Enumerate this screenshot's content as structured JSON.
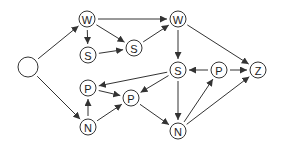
{
  "diagram": {
    "type": "directed-graph",
    "colors": {
      "stroke": "#333333",
      "node_fill": "#ffffff",
      "label": "#222222"
    },
    "nodes": [
      {
        "id": "start",
        "label": "",
        "x": 28,
        "y": 67,
        "r": 10
      },
      {
        "id": "w1",
        "label": "W",
        "x": 87,
        "y": 19,
        "r": 8
      },
      {
        "id": "s1",
        "label": "S",
        "x": 88,
        "y": 55,
        "r": 8
      },
      {
        "id": "s2",
        "label": "S",
        "x": 134,
        "y": 48,
        "r": 8
      },
      {
        "id": "w2",
        "label": "W",
        "x": 178,
        "y": 19,
        "r": 8
      },
      {
        "id": "s3",
        "label": "S",
        "x": 178,
        "y": 70,
        "r": 8
      },
      {
        "id": "p3",
        "label": "P",
        "x": 219,
        "y": 70,
        "r": 8
      },
      {
        "id": "z",
        "label": "Z",
        "x": 258,
        "y": 70,
        "r": 8
      },
      {
        "id": "p1",
        "label": "P",
        "x": 88,
        "y": 88,
        "r": 8
      },
      {
        "id": "p2",
        "label": "P",
        "x": 131,
        "y": 98,
        "r": 8
      },
      {
        "id": "n1",
        "label": "N",
        "x": 88,
        "y": 127,
        "r": 8
      },
      {
        "id": "n2",
        "label": "N",
        "x": 178,
        "y": 131,
        "r": 8
      }
    ],
    "edges": [
      {
        "from": "start",
        "to": "w1"
      },
      {
        "from": "start",
        "to": "n1"
      },
      {
        "from": "w1",
        "to": "s1"
      },
      {
        "from": "w1",
        "to": "s2"
      },
      {
        "from": "w1",
        "to": "w2"
      },
      {
        "from": "s1",
        "to": "s2"
      },
      {
        "from": "s2",
        "to": "w2"
      },
      {
        "from": "w2",
        "to": "s3"
      },
      {
        "from": "w2",
        "to": "z"
      },
      {
        "from": "s3",
        "to": "p1"
      },
      {
        "from": "s3",
        "to": "p2"
      },
      {
        "from": "s3",
        "to": "n2"
      },
      {
        "from": "p3",
        "to": "s3"
      },
      {
        "from": "p3",
        "to": "z"
      },
      {
        "from": "n2",
        "to": "p3"
      },
      {
        "from": "n2",
        "to": "z"
      },
      {
        "from": "n1",
        "to": "p1"
      },
      {
        "from": "n1",
        "to": "p2"
      },
      {
        "from": "p1",
        "to": "p2"
      },
      {
        "from": "p2",
        "to": "n2"
      }
    ]
  }
}
